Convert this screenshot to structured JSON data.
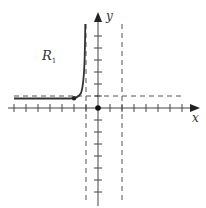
{
  "diagram": {
    "type": "coordinate-plane-graph",
    "axes": {
      "x_label": "x",
      "y_label": "y",
      "origin_px": [
        98,
        108
      ],
      "tick_spacing_px": 12,
      "x_ticks": [
        -7,
        -6,
        -5,
        -4,
        -3,
        -2,
        -1,
        1,
        2,
        3,
        4,
        5,
        6,
        7,
        8
      ],
      "y_ticks": [
        -7,
        -6,
        -5,
        -4,
        -3,
        -2,
        -1,
        1,
        2,
        3,
        4,
        5,
        6,
        7
      ]
    },
    "region_label": "R",
    "region_subscript": "1",
    "asymptotes": [
      {
        "kind": "vertical",
        "x": -1,
        "style": "dashed"
      },
      {
        "kind": "vertical",
        "x": 2,
        "style": "dashed"
      },
      {
        "kind": "horizontal",
        "y": 1,
        "style": "dashed"
      }
    ],
    "curve": {
      "description": "Curve approaching horizontal asymptote y=1 on the left and rising steeply toward vertical asymptote x=-1",
      "marked_point": [
        -2,
        1
      ]
    },
    "colors": {
      "axis": "#444444",
      "curve": "#333333",
      "dashed": "#555555",
      "background": "#ffffff"
    }
  }
}
